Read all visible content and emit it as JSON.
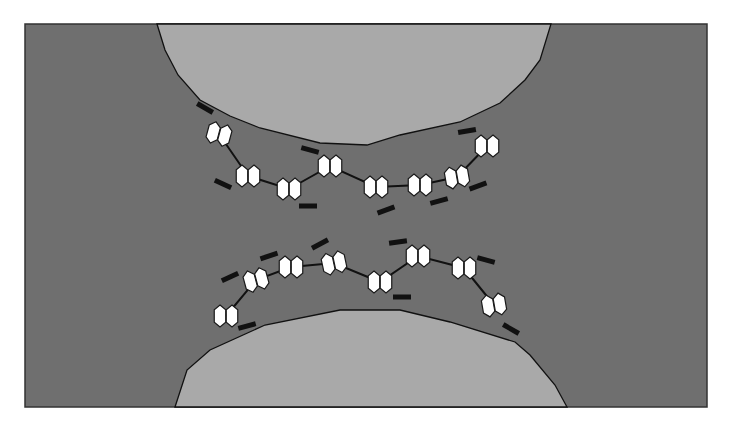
{
  "figure": {
    "type": "schematic",
    "colors": {
      "background": "#ffffff",
      "medium": "#6f6f6f",
      "particle": "#a9a9a9",
      "frame_border": "#333333",
      "hexagon_fill": "#ffffff",
      "outline": "#111111"
    },
    "frame": {
      "x": 25,
      "y": 24,
      "width": 682,
      "height": 383
    },
    "particles": [
      {
        "name": "top-particle",
        "points": [
          [
            157,
            24
          ],
          [
            165,
            50
          ],
          [
            178,
            75
          ],
          [
            200,
            100
          ],
          [
            230,
            116
          ],
          [
            260,
            128
          ],
          [
            320,
            143
          ],
          [
            367,
            145
          ],
          [
            400,
            135
          ],
          [
            460,
            122
          ],
          [
            500,
            103
          ],
          [
            525,
            80
          ],
          [
            540,
            60
          ],
          [
            551,
            24
          ]
        ]
      },
      {
        "name": "bottom-particle",
        "points": [
          [
            175,
            407
          ],
          [
            187,
            370
          ],
          [
            210,
            350
          ],
          [
            265,
            325
          ],
          [
            340,
            310
          ],
          [
            400,
            310
          ],
          [
            450,
            322
          ],
          [
            515,
            342
          ],
          [
            530,
            355
          ],
          [
            555,
            385
          ],
          [
            567,
            407
          ]
        ]
      }
    ],
    "chains": [
      {
        "name": "top-chain",
        "units": [
          {
            "cx": 219,
            "cy": 134,
            "rot": 15
          },
          {
            "cx": 248,
            "cy": 176,
            "rot": 0
          },
          {
            "cx": 289,
            "cy": 189,
            "rot": 0
          },
          {
            "cx": 330,
            "cy": 166,
            "rot": 0
          },
          {
            "cx": 376,
            "cy": 187,
            "rot": 0
          },
          {
            "cx": 420,
            "cy": 185,
            "rot": 0
          },
          {
            "cx": 457,
            "cy": 177,
            "rot": -10
          },
          {
            "cx": 487,
            "cy": 146,
            "rot": 0
          }
        ],
        "charges": [
          {
            "x": 205,
            "y": 108,
            "rot": 30
          },
          {
            "x": 223,
            "y": 184,
            "rot": 25
          },
          {
            "x": 308,
            "y": 206,
            "rot": 0
          },
          {
            "x": 310,
            "y": 150,
            "rot": 15
          },
          {
            "x": 386,
            "y": 210,
            "rot": -20
          },
          {
            "x": 439,
            "y": 201,
            "rot": -15
          },
          {
            "x": 478,
            "y": 186,
            "rot": -20
          },
          {
            "x": 467,
            "y": 131,
            "rot": -10
          }
        ]
      },
      {
        "name": "bottom-chain",
        "units": [
          {
            "cx": 226,
            "cy": 316,
            "rot": 0
          },
          {
            "cx": 256,
            "cy": 280,
            "rot": -15
          },
          {
            "cx": 291,
            "cy": 267,
            "rot": 0
          },
          {
            "cx": 334,
            "cy": 263,
            "rot": -12
          },
          {
            "cx": 380,
            "cy": 282,
            "rot": 0
          },
          {
            "cx": 418,
            "cy": 256,
            "rot": 0
          },
          {
            "cx": 464,
            "cy": 268,
            "rot": 0
          },
          {
            "cx": 494,
            "cy": 305,
            "rot": -10
          }
        ],
        "charges": [
          {
            "x": 230,
            "y": 277,
            "rot": -25
          },
          {
            "x": 269,
            "y": 256,
            "rot": -18
          },
          {
            "x": 247,
            "y": 326,
            "rot": -15
          },
          {
            "x": 320,
            "y": 244,
            "rot": -28
          },
          {
            "x": 398,
            "y": 242,
            "rot": -8
          },
          {
            "x": 402,
            "y": 297,
            "rot": 0
          },
          {
            "x": 486,
            "y": 260,
            "rot": 15
          },
          {
            "x": 511,
            "y": 329,
            "rot": 30
          }
        ]
      }
    ]
  }
}
